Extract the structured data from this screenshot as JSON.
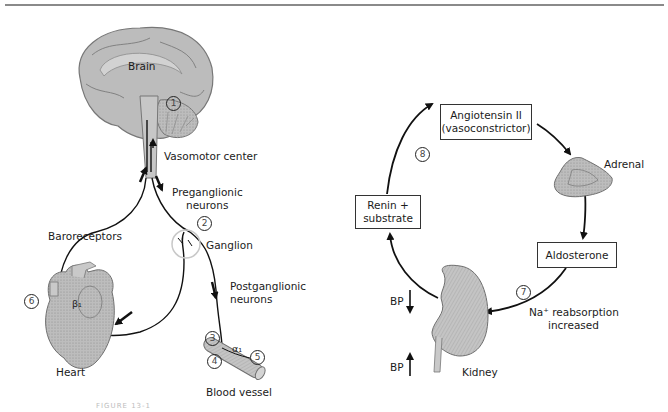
{
  "figure": {
    "caption": "FIGURE 13-1",
    "top_rule_color": "#8a8a8a"
  },
  "left_panel": {
    "title": "Sympathetic baroreceptor reflex",
    "labels": {
      "brain": "Brain",
      "vasomotor_center": "Vasomotor center",
      "preganglionic_1": "Preganglionic",
      "preganglionic_2": "neurons",
      "ganglion": "Ganglion",
      "postganglionic_1": "Postganglionic",
      "postganglionic_2": "neurons",
      "baroreceptors": "Baroreceptors",
      "heart": "Heart",
      "beta1": "β₁",
      "alpha1": "α₁",
      "blood_vessel": "Blood vessel"
    },
    "markers": [
      {
        "id": "1",
        "label": "1"
      },
      {
        "id": "2",
        "label": "2"
      },
      {
        "id": "3",
        "label": "3"
      },
      {
        "id": "4",
        "label": "4"
      },
      {
        "id": "5",
        "label": "5"
      },
      {
        "id": "6",
        "label": "6"
      }
    ]
  },
  "right_panel": {
    "title": "Renin-angiotensin-aldosterone cycle",
    "boxes": {
      "angiotensin_line1": "Angiotensin II",
      "angiotensin_line2": "(vasoconstrictor)",
      "renin_line1": "Renin +",
      "renin_line2": "substrate",
      "aldosterone": "Aldosterone"
    },
    "labels": {
      "adrenal": "Adrenal",
      "kidney": "Kidney",
      "na_line1": "Na⁺ reabsorption",
      "na_line2": "increased",
      "bp_down": "BP",
      "bp_up": "BP"
    },
    "markers": [
      {
        "id": "7",
        "label": "7"
      },
      {
        "id": "8",
        "label": "8"
      }
    ]
  },
  "colors": {
    "organ_fill": "#b9b9b9",
    "organ_stroke": "#6f6f6f",
    "line": "#111111",
    "ganglion_circle": "#c8c8c8"
  }
}
